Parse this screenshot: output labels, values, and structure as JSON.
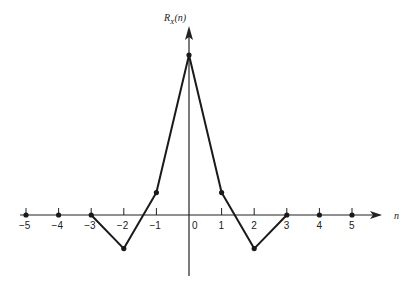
{
  "chart_data": {
    "type": "line",
    "title": "",
    "xlabel": "n",
    "ylabel": "R_X(n)",
    "ylabel_main": "R",
    "ylabel_sub": "X",
    "ylabel_arg": "(n)",
    "x": [
      -5,
      -4,
      -3,
      -2,
      -1,
      0,
      1,
      2,
      3,
      4,
      5
    ],
    "values": [
      0,
      0,
      0,
      -0.21,
      0.14,
      1.0,
      0.14,
      -0.21,
      0,
      0,
      0
    ],
    "series": [
      {
        "name": "R_X(n)",
        "x": [
          -5,
          -4,
          -3,
          -2,
          -1,
          0,
          1,
          2,
          3,
          4,
          5
        ],
        "values": [
          0,
          0,
          0,
          -0.21,
          0.14,
          1.0,
          0.14,
          -0.21,
          0,
          0,
          0
        ]
      }
    ],
    "tick_labels": [
      "-5",
      "-4",
      "-3",
      "-2",
      "-1",
      "0",
      "1",
      "2",
      "3",
      "4",
      "5"
    ],
    "xlim": [
      -5.5,
      6.2
    ],
    "ylim": [
      -0.35,
      1.2
    ],
    "grid": false,
    "legend": "none",
    "connected_segment": {
      "from": -3,
      "to": 3
    }
  }
}
